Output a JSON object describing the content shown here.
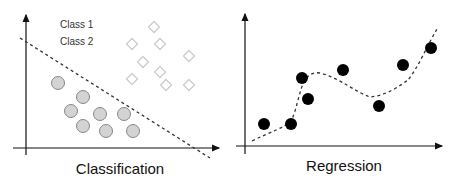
{
  "classification": {
    "caption": "Classification",
    "legend": [
      "Class 1",
      "Class 2"
    ],
    "class_circles": [
      [
        58,
        83
      ],
      [
        83,
        97
      ],
      [
        71,
        111
      ],
      [
        100,
        114
      ],
      [
        124,
        114
      ],
      [
        83,
        126
      ],
      [
        106,
        131
      ],
      [
        133,
        131
      ]
    ],
    "class_diamonds": [
      [
        154,
        27
      ],
      [
        132,
        44
      ],
      [
        160,
        44
      ],
      [
        189,
        56
      ],
      [
        143,
        62
      ],
      [
        160,
        72
      ],
      [
        132,
        79
      ],
      [
        166,
        85
      ],
      [
        189,
        85
      ]
    ],
    "boundary": [
      [
        20,
        38
      ],
      [
        210,
        158
      ]
    ],
    "colors": {
      "circle_fill": "#d3d3d3",
      "circle_stroke": "#888888",
      "diamond_stroke": "#cccccc",
      "axis": "#111111"
    }
  },
  "regression": {
    "caption": "Regression",
    "points": [
      [
        264,
        124
      ],
      [
        291,
        124
      ],
      [
        302,
        78
      ],
      [
        308,
        99
      ],
      [
        343,
        70
      ],
      [
        379,
        106
      ],
      [
        403,
        65
      ],
      [
        431,
        48
      ]
    ],
    "fit_curve": "M252,141 C270,132 284,128 291,121 C297,110 299,90 305,80 C309,74 314,72 320,73 C340,78 355,92 370,97 C385,96 400,86 408,80 C418,68 428,44 437,29",
    "colors": {
      "point_fill": "#000000",
      "axis": "#111111"
    }
  }
}
